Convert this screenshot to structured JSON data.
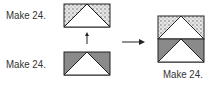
{
  "labels": {
    "top_left": "Make 24.",
    "bottom_left": "Make 24.",
    "result": "Make 24."
  },
  "colors": {
    "gray_fill": "#8a8a8a",
    "pattern_fill": "#d8d8d8",
    "outline": "#222222",
    "white": "#ffffff"
  },
  "blocks": [
    {
      "id": "patterned-flying-geese",
      "fill": "patterned"
    },
    {
      "id": "gray-flying-geese",
      "fill": "gray"
    },
    {
      "id": "combined-block",
      "fill": "patterned-over-gray"
    }
  ]
}
